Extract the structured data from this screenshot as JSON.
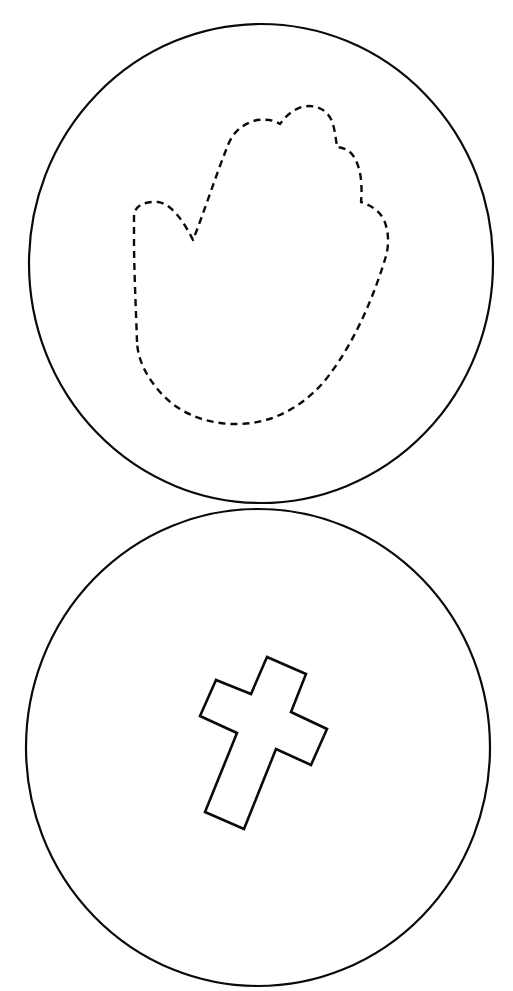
{
  "page": {
    "background": "#ffffff",
    "line_color": "#0a0a0a"
  },
  "shapes": [
    {
      "id": "top-circle",
      "kind": "circle",
      "content": "dashed hand outline (cut line)"
    },
    {
      "id": "bottom-circle",
      "kind": "circle",
      "content": "tilted cross outline"
    }
  ],
  "labels": {
    "top_circle": "Top circle with dashed hand outline",
    "bottom_circle": "Bottom circle with cross outline"
  }
}
